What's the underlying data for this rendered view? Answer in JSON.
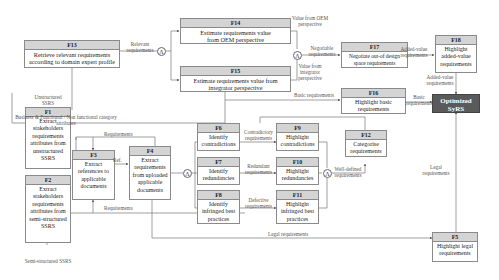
{
  "boxes": {
    "f13": {
      "id": "F13",
      "text": "Retrieve relevant requirements according to domain expert profile"
    },
    "f14": {
      "id": "F14",
      "text": "Estimate requirements value from OEM perspective"
    },
    "f15": {
      "id": "F15",
      "text": "Estimate requirements value from integrator perspective"
    },
    "f17": {
      "id": "F17",
      "text": "Negotiate out-of design space requirements"
    },
    "f18": {
      "id": "F18",
      "text": "Highlight added-value requirements"
    },
    "f16": {
      "id": "F16",
      "text": "Highlight basic requirements"
    },
    "f1": {
      "id": "F1",
      "text": "Extract stakeholders requirements attributes from unstructured SSRS"
    },
    "f2": {
      "id": "F2",
      "text": "Extract stakeholders requirements attributes from semi-structured SSRS"
    },
    "f3": {
      "id": "F3",
      "text": "Extract references to applicable documents"
    },
    "f4": {
      "id": "F4",
      "text": "Extract requirements from uploaded applicable documents"
    },
    "f6": {
      "id": "F6",
      "text": "Identify contradictions"
    },
    "f7": {
      "id": "F7",
      "text": "Identify redundancies"
    },
    "f8": {
      "id": "F8",
      "text": "Identify infringed best practices"
    },
    "f9": {
      "id": "F9",
      "text": "Highlight contradictions"
    },
    "f10": {
      "id": "F10",
      "text": "Highlight redundancies"
    },
    "f11": {
      "id": "F11",
      "text": "Highlight infringed best practices"
    },
    "f12": {
      "id": "F12",
      "text": "Categorise requirements"
    },
    "f5": {
      "id": "F5",
      "text": "Highlight legal requirements"
    }
  },
  "output": {
    "text_line1": "Optimized",
    "text_line2": "SyRS"
  },
  "labels": {
    "unstructured_ssrs": "Unstructured SSRS",
    "semi_structured_ssrs": "Semi-structured SSRS",
    "relevant_requirements": "Relevant requirements",
    "value_from_oem": "Value from OEM perspective",
    "value_from_integrator": "Value from integrator perspective",
    "negotiable_requirements": "Negotiable requirements",
    "added_value_requirements_1": "Added-value requirements",
    "added_value_requirements_2": "Added-value requirements",
    "basic_requirements_1": "Basic requirements",
    "basic_requirements_2": "Basic requirements",
    "business_functional": "Business & Functional / Non functional category attributes",
    "requirements_top": "Requirements",
    "requirements_bottom": "Requirements",
    "ref": "Ref.",
    "contradictory_requirements": "Contradictory requirements",
    "redundant_requirements": "Redundant requirements",
    "defective_requirements": "Defective requirements",
    "well_defined_requirements": "Well-defined requirements",
    "legal_requirements_1": "Legal requirements",
    "legal_requirements_2": "Legal requirements"
  },
  "and_symbol": "Λ"
}
